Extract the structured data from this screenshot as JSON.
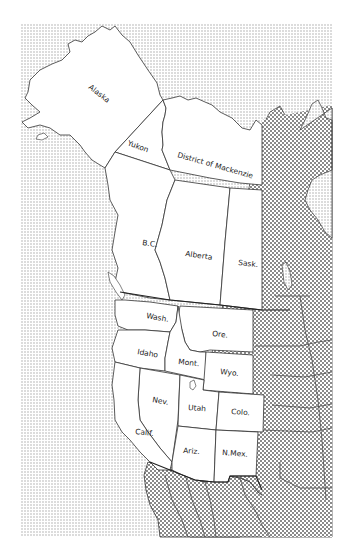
{
  "map": {
    "title": "",
    "colors": {
      "water_dots": "#b8b8b8",
      "land_outside_crosshatch": "#9a9a9a",
      "region_fill": "#ffffff",
      "border": "#333333"
    },
    "legend": [],
    "regions": [
      {
        "id": "alaska",
        "label": "Alaska"
      },
      {
        "id": "yukon",
        "label": "Yukon"
      },
      {
        "id": "mackenzie",
        "label": "District of Mackenzie"
      },
      {
        "id": "bc",
        "label": "B.C."
      },
      {
        "id": "alberta",
        "label": "Alberta"
      },
      {
        "id": "sask",
        "label": "Sask."
      },
      {
        "id": "wash",
        "label": "Wash."
      },
      {
        "id": "ore",
        "label": "Ore."
      },
      {
        "id": "idaho",
        "label": "Idaho"
      },
      {
        "id": "mont",
        "label": "Mont."
      },
      {
        "id": "wyo",
        "label": "Wyo."
      },
      {
        "id": "nev",
        "label": "Nev."
      },
      {
        "id": "utah",
        "label": "Utah"
      },
      {
        "id": "colo",
        "label": "Colo."
      },
      {
        "id": "calif",
        "label": "Calif."
      },
      {
        "id": "ariz",
        "label": "Ariz."
      },
      {
        "id": "nmex",
        "label": "N.Mex."
      }
    ]
  }
}
